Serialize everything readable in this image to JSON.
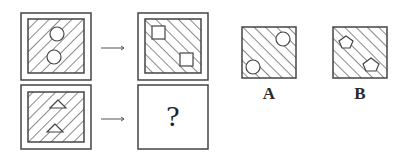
{
  "puzzle": {
    "question_mark": "?",
    "options": [
      {
        "label": "A",
        "shape": "circle",
        "hatch": "forward-slash"
      },
      {
        "label": "B",
        "shape": "pentagon",
        "hatch": "forward-slash"
      }
    ],
    "row1": {
      "source_shape": "circle",
      "source_hatch": "back-slash",
      "target_shape": "square",
      "target_hatch": "forward-slash"
    },
    "row2": {
      "source_shape": "triangle",
      "source_hatch": "back-slash",
      "target": "unknown"
    }
  },
  "colors": {
    "line": "#3a3a3a",
    "background": "#ffffff"
  }
}
